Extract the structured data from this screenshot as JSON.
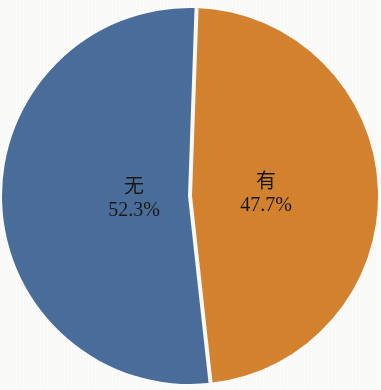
{
  "chart_data": {
    "type": "pie",
    "title": "",
    "subtitle": "",
    "xlabel": "",
    "ylabel": "",
    "legend_position": "none",
    "grid": false,
    "labels_inside_slices": true,
    "categories": [
      "无",
      "有"
    ],
    "values": [
      52.3,
      47.7
    ],
    "value_unit": "%",
    "start_angle_deg": 0,
    "direction": "counterclockwise",
    "slices": [
      {
        "name": "无",
        "value": 52.3,
        "value_label": "52.3%",
        "color": "#4a6e9c",
        "angle_deg": 188.3
      },
      {
        "name": "有",
        "value": 47.7,
        "value_label": "47.7%",
        "color": "#d6832f",
        "angle_deg": 171.7
      }
    ],
    "colors": [
      "#4a6e9c",
      "#d6832f"
    ],
    "separator_color": "#fdfbf6",
    "background_color": "#fdfdfb"
  }
}
